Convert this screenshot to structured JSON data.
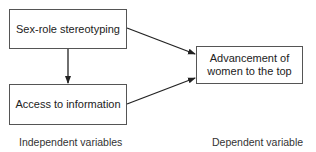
{
  "diagram": {
    "nodes": [
      {
        "id": "sex-role",
        "label": "Sex-role stereotyping"
      },
      {
        "id": "access",
        "label": "Access to information"
      },
      {
        "id": "advancement",
        "label": "Advancement of women to the top"
      }
    ],
    "edges": [
      {
        "from": "sex-role",
        "to": "access"
      },
      {
        "from": "sex-role",
        "to": "advancement"
      },
      {
        "from": "access",
        "to": "advancement"
      }
    ],
    "labels": {
      "independent": "Independent variables",
      "dependent": "Dependent variable"
    }
  }
}
